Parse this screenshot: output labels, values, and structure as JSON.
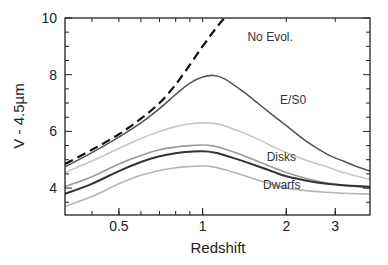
{
  "chart_data": {
    "type": "line",
    "title": "",
    "xlabel": "Redshift",
    "ylabel": "V - 4.5µm",
    "xscale": "log",
    "xlim": [
      0.32,
      4.0
    ],
    "ylim": [
      3.05,
      10
    ],
    "xticks": [
      0.5,
      1,
      2,
      3
    ],
    "xtick_labels": [
      "0.5",
      "1",
      "2",
      "3"
    ],
    "yticks": [
      4,
      6,
      8,
      10
    ],
    "ytick_labels": [
      "4",
      "6",
      "8",
      "10"
    ],
    "grid": false,
    "legend": null,
    "annotations": [
      {
        "text": "No Evol.",
        "x": 1.45,
        "y": 9.2
      },
      {
        "text": "E/S0",
        "x": 1.9,
        "y": 6.95
      },
      {
        "text": "Disks",
        "x": 1.7,
        "y": 4.95
      },
      {
        "text": "Dwarfs",
        "x": 1.65,
        "y": 3.95
      }
    ],
    "x": [
      0.32,
      0.4,
      0.5,
      0.6,
      0.7,
      0.8,
      0.9,
      1.0,
      1.1,
      1.2,
      1.4,
      1.6,
      1.8,
      2.0,
      2.4,
      2.8,
      3.2,
      3.6,
      4.0
    ],
    "series": [
      {
        "name": "No Evol.",
        "style": "dashed",
        "color": "#111111",
        "values": [
          4.85,
          5.35,
          5.9,
          6.45,
          7.0,
          7.65,
          8.35,
          9.0,
          9.55,
          10.0,
          null,
          null,
          null,
          null,
          null,
          null,
          null,
          null,
          null
        ]
      },
      {
        "name": "E/S0",
        "style": "solid",
        "color": "#555555",
        "values": [
          4.75,
          5.25,
          5.8,
          6.3,
          6.8,
          7.3,
          7.7,
          7.92,
          7.97,
          7.85,
          7.4,
          6.95,
          6.55,
          6.2,
          5.6,
          5.2,
          4.95,
          4.75,
          4.6
        ]
      },
      {
        "name": "Disks (upper)",
        "style": "solid",
        "color": "#c8c8c8",
        "values": [
          4.55,
          4.95,
          5.4,
          5.75,
          6.0,
          6.17,
          6.27,
          6.3,
          6.28,
          6.2,
          5.95,
          5.7,
          5.45,
          5.25,
          4.95,
          4.75,
          4.55,
          4.42,
          4.3
        ]
      },
      {
        "name": "Disks",
        "style": "solid",
        "color": "#9a9a9a",
        "values": [
          4.05,
          4.4,
          4.85,
          5.15,
          5.35,
          5.45,
          5.5,
          5.52,
          5.48,
          5.38,
          5.15,
          4.92,
          4.72,
          4.55,
          4.32,
          4.18,
          4.1,
          4.05,
          4.0
        ]
      },
      {
        "name": "Dwarfs (mid)",
        "style": "solid",
        "color": "#333333",
        "values": [
          3.8,
          4.15,
          4.6,
          4.92,
          5.12,
          5.23,
          5.28,
          5.3,
          5.26,
          5.16,
          4.95,
          4.75,
          4.57,
          4.42,
          4.25,
          4.15,
          4.1,
          4.07,
          4.05
        ]
      },
      {
        "name": "Dwarfs",
        "style": "solid",
        "color": "#b5b5b5",
        "values": [
          3.35,
          3.7,
          4.15,
          4.45,
          4.62,
          4.72,
          4.76,
          4.78,
          4.74,
          4.65,
          4.45,
          4.27,
          4.12,
          4.0,
          3.9,
          3.85,
          3.82,
          3.8,
          3.78
        ]
      }
    ]
  }
}
